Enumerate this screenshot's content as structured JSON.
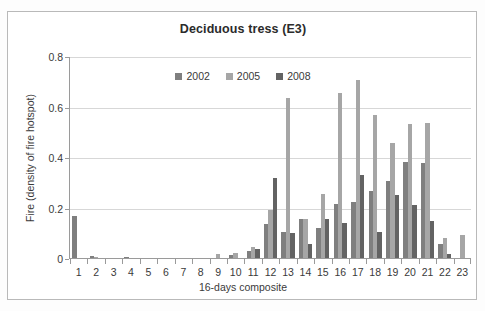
{
  "chart_data": {
    "type": "bar",
    "title": "Deciduous tress (E3)",
    "xlabel": "16-days composite",
    "ylabel": "Fire (density of fire hotspot)",
    "ylim": [
      0,
      0.8
    ],
    "yticks": [
      "0",
      "0.2",
      "0.4",
      "0.6",
      "0.8"
    ],
    "ytick_values": [
      0,
      0.2,
      0.4,
      0.6,
      0.8
    ],
    "grid": true,
    "legend_position": "top-center",
    "categories": [
      "1",
      "2",
      "3",
      "4",
      "5",
      "6",
      "7",
      "8",
      "9",
      "10",
      "11",
      "12",
      "13",
      "14",
      "15",
      "16",
      "17",
      "18",
      "19",
      "20",
      "21",
      "22",
      "23"
    ],
    "series": [
      {
        "name": "2002",
        "color": "#7f7f7f",
        "values": [
          0.165,
          0.008,
          0,
          0.005,
          0,
          0,
          0,
          0,
          0,
          0.01,
          0.028,
          0.135,
          0.105,
          0.155,
          0.12,
          0.215,
          0.22,
          0.265,
          0.305,
          0.38,
          0.375,
          0.055,
          0
        ]
      },
      {
        "name": "2005",
        "color": "#a6a6a6",
        "values": [
          0,
          0.006,
          0,
          0,
          0,
          0,
          0,
          0,
          0.015,
          0.018,
          0.045,
          0.19,
          0.635,
          0.155,
          0.255,
          0.655,
          0.705,
          0.565,
          0.455,
          0.53,
          0.535,
          0.08,
          0.09
        ]
      },
      {
        "name": "2008",
        "color": "#636363",
        "values": [
          0,
          0,
          0,
          0,
          0,
          0,
          0,
          0,
          0,
          0,
          0.035,
          0.315,
          0.1,
          0.055,
          0.155,
          0.14,
          0.33,
          0.105,
          0.25,
          0.21,
          0.145,
          0.015,
          0
        ]
      }
    ]
  }
}
